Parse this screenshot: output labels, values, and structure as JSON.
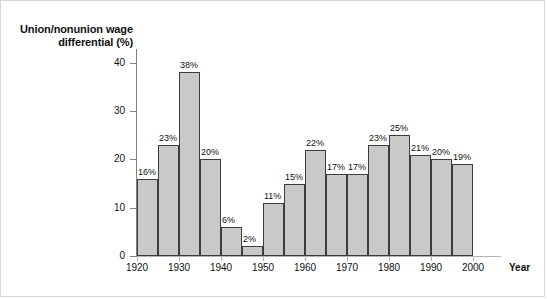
{
  "chart_data": {
    "type": "bar",
    "title": "",
    "ylabel": "Union/nonunion wage differential (%)",
    "xlabel": "Year",
    "ylim": [
      0,
      44
    ],
    "yticks": [
      0,
      10,
      20,
      30,
      40
    ],
    "ytick_labels": [
      "0",
      "10",
      "20",
      "30",
      "40"
    ],
    "xticks": [
      1920,
      1930,
      1940,
      1950,
      1960,
      1970,
      1980,
      1990,
      2000
    ],
    "xtick_labels": [
      "1920",
      "1930",
      "1940",
      "1950",
      "1960",
      "1970",
      "1980",
      "1990",
      "2000"
    ],
    "grid": false,
    "legend": "none",
    "bar_fill": "#c9c9c9",
    "bar_edge": "#3c3c3c",
    "categories": [
      1920,
      1925,
      1930,
      1935,
      1940,
      1945,
      1950,
      1955,
      1960,
      1965,
      1970,
      1975,
      1980,
      1985,
      1990,
      1995
    ],
    "values": [
      16,
      23,
      38,
      20,
      6,
      2,
      11,
      15,
      22,
      17,
      17,
      23,
      25,
      21,
      20,
      19
    ],
    "data_labels": [
      "16%",
      "23%",
      "38%",
      "20%",
      "6%",
      "2%",
      "11%",
      "15%",
      "22%",
      "17%",
      "17%",
      "23%",
      "25%",
      "21%",
      "20%",
      "19%"
    ]
  }
}
